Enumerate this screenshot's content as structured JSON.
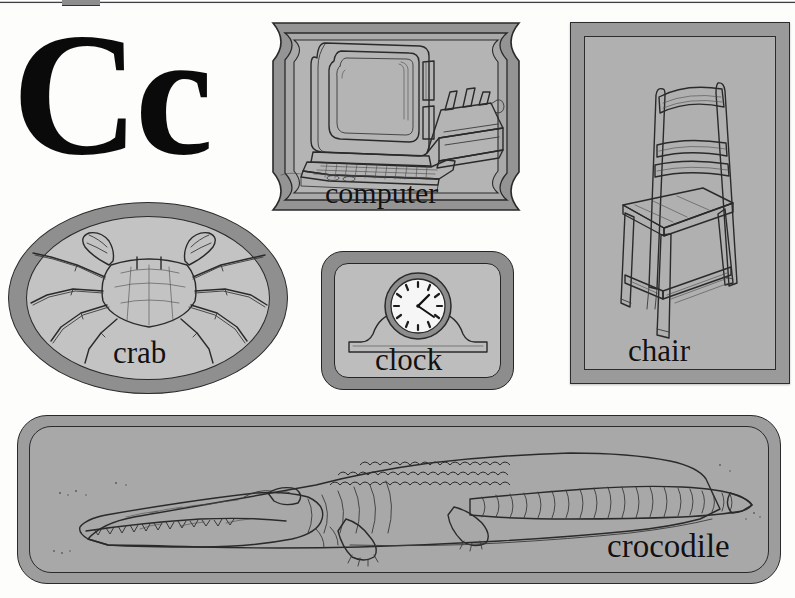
{
  "page": {
    "letter": "Cc",
    "letter_uppercase": "C",
    "letter_lowercase": "c",
    "background_color": "#fdfdfc",
    "panel_fill_color": "#a9a9a9",
    "panel_border_color": "#2a2a2a",
    "ink_color": "#2a2a2a"
  },
  "panels": [
    {
      "id": "computer",
      "label": "computer",
      "frame_shape": "scalloped-octagon",
      "illustration": "desktop-computer-with-monitor-keyboard-and-printer"
    },
    {
      "id": "chair",
      "label": "chair",
      "frame_shape": "rectangle",
      "illustration": "wooden-ladder-back-chair"
    },
    {
      "id": "crab",
      "label": "crab",
      "frame_shape": "oval",
      "illustration": "crab-top-view-with-claws-and-eight-legs"
    },
    {
      "id": "clock",
      "label": "clock",
      "frame_shape": "rounded-rectangle",
      "illustration": "mantel-clock-with-round-analog-face",
      "clock_time": "1:20"
    },
    {
      "id": "crocodile",
      "label": "crocodile",
      "frame_shape": "rounded-rectangle-wide",
      "illustration": "crocodile-full-body-side-view-facing-left"
    }
  ]
}
